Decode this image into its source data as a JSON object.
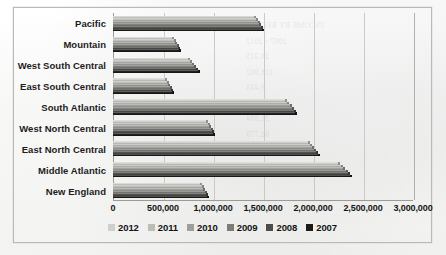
{
  "chart_data": {
    "type": "bar",
    "orientation": "horizontal",
    "title": "",
    "xlabel": "",
    "ylabel": "",
    "xlim": [
      0,
      3000000
    ],
    "xticks": [
      0,
      500000,
      1000000,
      1500000,
      2000000,
      2500000,
      3000000
    ],
    "xtick_labels": [
      "0",
      "500,000",
      "1,000,000",
      "1,500,000",
      "2,000,000",
      "2,500,000",
      "3,000,000"
    ],
    "grid": true,
    "legend_position": "bottom",
    "categories": [
      "Pacific",
      "Mountain",
      "West South Central",
      "East South Central",
      "South Atlantic",
      "West North Central",
      "East North Central",
      "Middle Atlantic",
      "New England"
    ],
    "series": [
      {
        "name": "2012",
        "color": "#cfcfcc",
        "values": [
          1420000,
          600000,
          760000,
          530000,
          1730000,
          940000,
          1960000,
          2260000,
          880000
        ]
      },
      {
        "name": "2011",
        "color": "#bcbcb8",
        "values": [
          1440000,
          615000,
          780000,
          545000,
          1750000,
          955000,
          1980000,
          2285000,
          895000
        ]
      },
      {
        "name": "2010",
        "color": "#9e9e9a",
        "values": [
          1455000,
          630000,
          800000,
          560000,
          1775000,
          970000,
          2000000,
          2310000,
          910000
        ]
      },
      {
        "name": "2009",
        "color": "#7c7c78",
        "values": [
          1470000,
          645000,
          820000,
          575000,
          1795000,
          985000,
          2020000,
          2335000,
          925000
        ]
      },
      {
        "name": "2008",
        "color": "#4c4c49",
        "values": [
          1485000,
          660000,
          840000,
          588000,
          1815000,
          998000,
          2040000,
          2358000,
          940000
        ]
      },
      {
        "name": "2007",
        "color": "#1a1a18",
        "values": [
          1500000,
          672000,
          858000,
          600000,
          1832000,
          1010000,
          2058000,
          2380000,
          952000
        ]
      }
    ]
  },
  "legend": {
    "items": [
      {
        "label": "2012",
        "color": "#cfcfcc"
      },
      {
        "label": "2011",
        "color": "#bcbcb8"
      },
      {
        "label": "2010",
        "color": "#9e9e9a"
      },
      {
        "label": "2009",
        "color": "#7c7c78"
      },
      {
        "label": "2008",
        "color": "#4c4c49"
      },
      {
        "label": "2007",
        "color": "#1a1a18"
      }
    ]
  },
  "scan": {
    "bleed_text": "INCOME BY REGION\n2007 - 2012\n  24,315\n 118,902\n  9,443\n 207,116\n  31,884\n 62,770\n  14,029\n  88,351"
  }
}
